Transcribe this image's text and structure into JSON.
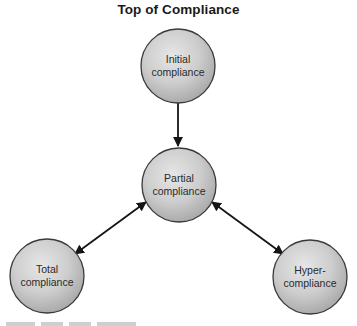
{
  "title": "Top of Compliance",
  "nodes": {
    "initial": {
      "line1": "Initial",
      "line2": "compliance"
    },
    "partial": {
      "line1": "Partial",
      "line2": "compliance"
    },
    "total": {
      "line1": "Total",
      "line2": "compliance"
    },
    "hyper": {
      "line1": "Hyper-",
      "line2": "compliance"
    }
  },
  "edges": [
    {
      "from": "Initial compliance",
      "to": "Partial compliance",
      "direction": "one-way"
    },
    {
      "from": "Partial compliance",
      "to": "Total compliance",
      "direction": "two-way"
    },
    {
      "from": "Partial compliance",
      "to": "Hyper-compliance",
      "direction": "two-way"
    }
  ],
  "colors": {
    "node_fill_light": "#e2e2e2",
    "node_fill_dark": "#a9a9a9",
    "node_stroke": "#3a3a3a",
    "arrow": "#151515"
  }
}
